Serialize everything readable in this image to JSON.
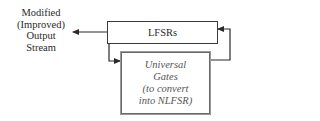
{
  "diagram": {
    "output_label": {
      "lines": [
        "Modified",
        "(Improved)",
        "Output",
        "Stream"
      ]
    },
    "lfsr_box": {
      "label": "LFSRs"
    },
    "gates_box": {
      "lines": [
        "Universal",
        "Gates",
        "(to convert",
        "into NLFSR)"
      ]
    },
    "connections": [
      {
        "from": "lfsr_box",
        "to": "output_label",
        "type": "arrow"
      },
      {
        "from": "lfsr_box",
        "to": "gates_box",
        "type": "arrow"
      },
      {
        "from": "gates_box",
        "to": "lfsr_box",
        "type": "feedback-arrow"
      }
    ],
    "colors": {
      "line": "#2a2a2a",
      "gates_border": "#6a6a6a",
      "gates_text": "#555555"
    }
  }
}
